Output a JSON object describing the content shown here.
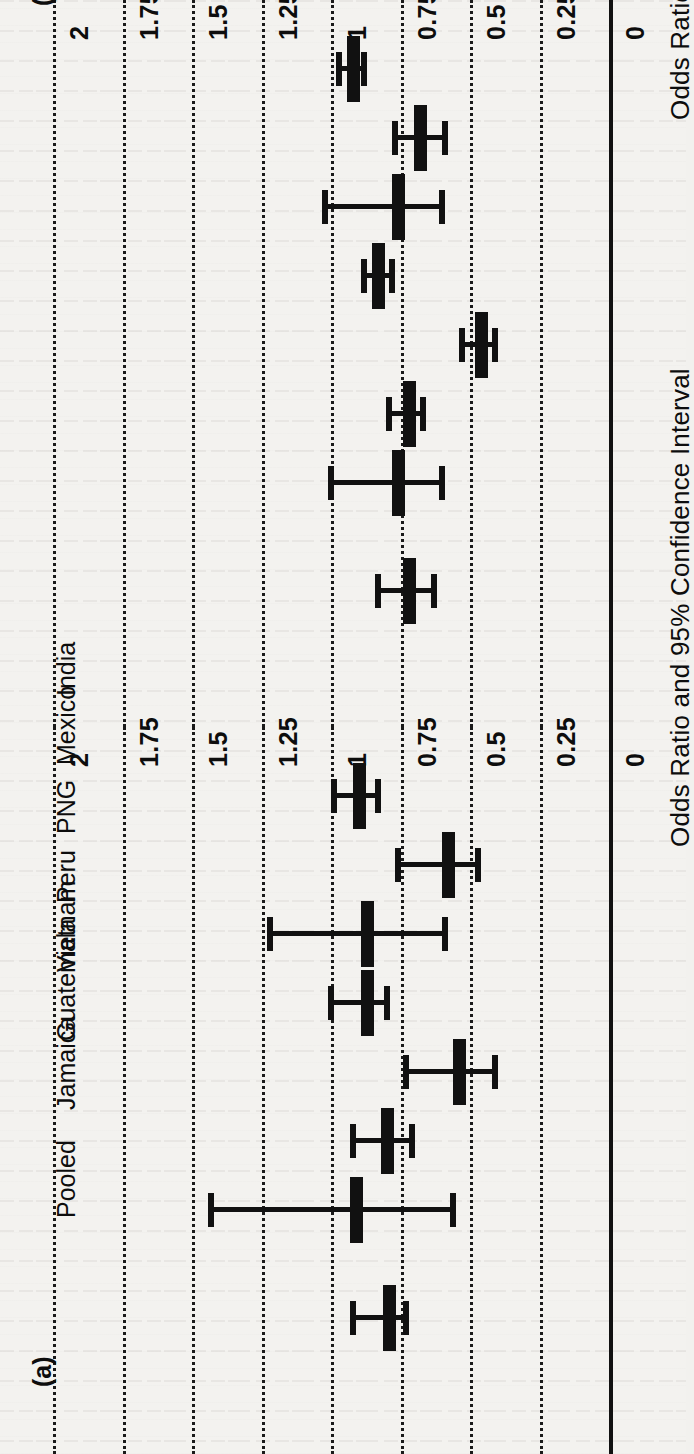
{
  "figure": {
    "orientation": "rotated-90-ccw",
    "axis_title": "Odds Ratio and 95% Confidence Interval",
    "tick_labels": [
      "0",
      "0.25",
      "0.5",
      "0.75",
      "1",
      "1.25",
      "1.5",
      "1.75",
      "2"
    ],
    "tick_values": [
      0,
      0.25,
      0.5,
      0.75,
      1,
      1.25,
      1.5,
      1.75,
      2
    ],
    "study_labels": [
      "India",
      "Mexico",
      "PNG",
      "Peru",
      "Vietnam",
      "Guatemala",
      "Jamaica",
      "Pooled"
    ],
    "ink_color": "#111111",
    "paper_color": "#f3f2ef"
  },
  "panels": [
    {
      "id": "panel-b",
      "label": "(b)"
    },
    {
      "id": "panel-a",
      "label": "(a)"
    }
  ],
  "chart_data": [
    {
      "type": "scatter",
      "subtype": "forest-plot",
      "panel": "(b)",
      "title": "",
      "xlabel": "Odds Ratio and 95% Confidence Interval",
      "ylabel": "",
      "xlim": [
        0,
        2
      ],
      "xticks": [
        0,
        0.25,
        0.5,
        0.75,
        1,
        1.25,
        1.5,
        1.75,
        2
      ],
      "grid": true,
      "legend": "none",
      "categories": [
        "India",
        "Mexico",
        "PNG",
        "Peru",
        "Vietnam",
        "Guatemala",
        "Jamaica",
        "Pooled"
      ],
      "estimates": [
        0.92,
        0.68,
        0.76,
        0.83,
        0.46,
        0.72,
        0.76,
        0.72
      ],
      "ci_low": [
        0.88,
        0.59,
        0.6,
        0.78,
        0.41,
        0.67,
        0.6,
        0.63
      ],
      "ci_high": [
        0.97,
        0.77,
        1.02,
        0.88,
        0.53,
        0.79,
        1.0,
        0.83
      ]
    },
    {
      "type": "scatter",
      "subtype": "forest-plot",
      "panel": "(a)",
      "title": "",
      "xlabel": "Odds Ratio and 95% Confidence Interval",
      "ylabel": "",
      "xlim": [
        0,
        2
      ],
      "xticks": [
        0,
        0.25,
        0.5,
        0.75,
        1,
        1.25,
        1.5,
        1.75,
        2
      ],
      "grid": true,
      "legend": "none",
      "categories": [
        "India",
        "Mexico",
        "PNG",
        "Peru",
        "Vietnam",
        "Guatemala",
        "Jamaica",
        "Pooled"
      ],
      "estimates": [
        0.9,
        0.58,
        0.87,
        0.87,
        0.54,
        0.8,
        0.91,
        0.79
      ],
      "ci_low": [
        0.83,
        0.47,
        0.59,
        0.8,
        0.41,
        0.71,
        0.56,
        0.73
      ],
      "ci_high": [
        0.99,
        0.76,
        1.22,
        1.0,
        0.73,
        0.92,
        1.43,
        0.92
      ]
    }
  ]
}
